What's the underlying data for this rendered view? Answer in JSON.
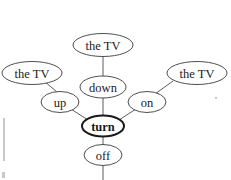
{
  "diagram": {
    "type": "dependency-tree",
    "title": "turn",
    "background_color": "#ffffff",
    "node_stroke_color": "#3a3a3a",
    "edge_stroke_color": "#4a4a4a",
    "text_color": "#1a1a1a",
    "nodes": [
      {
        "id": "the-tv-top",
        "label": "the TV",
        "cx": 103,
        "cy": 45,
        "rx": 30,
        "ry": 11.5,
        "font_size": 12.5,
        "root": false
      },
      {
        "id": "the-tv-left",
        "label": "the TV",
        "cx": 32,
        "cy": 73,
        "rx": 30,
        "ry": 11.5,
        "font_size": 12.5,
        "root": false
      },
      {
        "id": "the-tv-right",
        "label": "the TV",
        "cx": 197,
        "cy": 73,
        "rx": 30,
        "ry": 11.5,
        "font_size": 12.5,
        "root": false
      },
      {
        "id": "down",
        "label": "down",
        "cx": 103,
        "cy": 87,
        "rx": 23,
        "ry": 11,
        "font_size": 12.5,
        "root": false
      },
      {
        "id": "up",
        "label": "up",
        "cx": 60,
        "cy": 102,
        "rx": 19,
        "ry": 10.5,
        "font_size": 12.5,
        "root": false
      },
      {
        "id": "on",
        "label": "on",
        "cx": 147,
        "cy": 102,
        "rx": 19,
        "ry": 10.5,
        "font_size": 12.5,
        "root": false
      },
      {
        "id": "turn",
        "label": "turn",
        "cx": 103,
        "cy": 126,
        "rx": 21,
        "ry": 10.5,
        "font_size": 12.5,
        "root": true
      },
      {
        "id": "off",
        "label": "off",
        "cx": 103,
        "cy": 155,
        "rx": 19,
        "ry": 10.5,
        "font_size": 12.5,
        "root": false
      }
    ],
    "edges": [
      {
        "id": "edge-thetvtop-down",
        "from": "the-tv-top",
        "to": "down",
        "x1": 103,
        "y1": 57,
        "x2": 103,
        "y2": 76
      },
      {
        "id": "edge-thetvleft-up",
        "from": "the-tv-left",
        "to": "up",
        "x1": 44,
        "y1": 81,
        "x2": 57,
        "y2": 92
      },
      {
        "id": "edge-thetvright-on",
        "from": "the-tv-right",
        "to": "on",
        "x1": 173,
        "y1": 81,
        "x2": 155,
        "y2": 94
      },
      {
        "id": "edge-down-turn",
        "from": "down",
        "to": "turn",
        "x1": 103,
        "y1": 98,
        "x2": 103,
        "y2": 116
      },
      {
        "id": "edge-up-turn",
        "from": "up",
        "to": "turn",
        "x1": 71,
        "y1": 109,
        "x2": 88,
        "y2": 120
      },
      {
        "id": "edge-on-turn",
        "from": "on",
        "to": "turn",
        "x1": 136,
        "y1": 109,
        "x2": 119,
        "y2": 120
      },
      {
        "id": "edge-turn-off",
        "from": "turn",
        "to": "off",
        "x1": 103,
        "y1": 137,
        "x2": 103,
        "y2": 145
      },
      {
        "id": "edge-off-down",
        "from": "off",
        "to": null,
        "x1": 103,
        "y1": 166,
        "x2": 103,
        "y2": 180
      }
    ],
    "artifacts": [
      {
        "id": "left-margin-line",
        "x": 3,
        "y": 118,
        "width": 2,
        "height": 43,
        "color": "#c0c0c0"
      },
      {
        "id": "left-corner-mark",
        "x": 2,
        "y": 172,
        "width": 3,
        "height": 6,
        "color": "#b0b0b0"
      },
      {
        "id": "right-speck",
        "x": 215,
        "y": 97,
        "width": 2,
        "height": 2,
        "color": "#9a9a9a"
      }
    ]
  }
}
